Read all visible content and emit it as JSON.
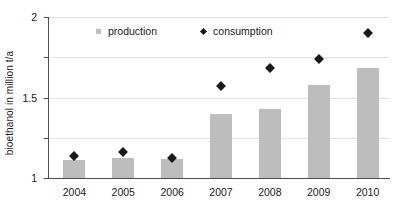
{
  "chart_data": {
    "type": "bar",
    "title": "",
    "subtitle": "",
    "xlabel": "",
    "ylabel": "bioethanol in million  t/a",
    "categories": [
      "2004",
      "2005",
      "2006",
      "2007",
      "2008",
      "2009",
      "2010"
    ],
    "ylim": [
      0,
      2
    ],
    "yticks": [
      0,
      0.5,
      1,
      1.5,
      2
    ],
    "ytick_labels": [
      "0",
      "0.5",
      "1",
      "1.5",
      "2"
    ],
    "grid": true,
    "legend_position": "top-center",
    "series": [
      {
        "name": "production",
        "type": "bar",
        "color": "#bdbdbd",
        "values": [
          0.22,
          0.25,
          0.24,
          0.79,
          0.86,
          1.15,
          1.37
        ]
      },
      {
        "name": "consumption",
        "type": "scatter",
        "marker": "diamond",
        "color": "#1a1a1a",
        "values": [
          0.28,
          0.33,
          0.26,
          1.15,
          1.38,
          1.49,
          1.81
        ]
      }
    ]
  },
  "legend": {
    "items": [
      {
        "label": "production",
        "icon": "square-marker-icon"
      },
      {
        "label": "consumption",
        "icon": "diamond-marker-icon"
      }
    ]
  }
}
